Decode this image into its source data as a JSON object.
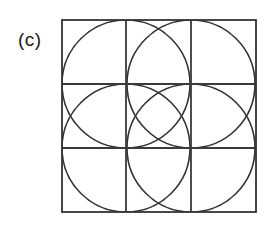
{
  "figure": {
    "label": "(c)",
    "type": "geometric-construction",
    "background_color": "#ffffff",
    "stroke_color": "#333333",
    "grid_stroke_color": "#3a3a3a",
    "border_stroke_color": "#333333",
    "stroke_width": 1.6,
    "border_stroke_width": 1.8,
    "square": {
      "x": 62,
      "y": 20,
      "width": 194,
      "height": 192
    },
    "grid": {
      "rows": 3,
      "columns": 3,
      "vertical_lines_x": [
        126,
        191
      ],
      "horizontal_lines_y": [
        84,
        148
      ]
    },
    "circles": [
      {
        "name": "top-left-circle",
        "cx": 126,
        "cy": 84,
        "r": 64
      },
      {
        "name": "top-right-circle",
        "cx": 191,
        "cy": 84,
        "r": 64
      },
      {
        "name": "bottom-left-circle",
        "cx": 126,
        "cy": 148,
        "r": 64
      },
      {
        "name": "bottom-right-circle",
        "cx": 191,
        "cy": 148,
        "r": 64
      }
    ]
  }
}
